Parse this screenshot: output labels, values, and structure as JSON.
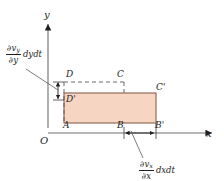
{
  "figure": {
    "type": "fluid-element-deformation-diagram",
    "background": "#ffffff",
    "ink_color": "#231f20",
    "fill_color": "#f6d6c3",
    "fill_stroke": "#8c5f4e"
  },
  "axes": {
    "x_label": "x",
    "y_label": "y",
    "origin_label": "O",
    "x_axis": {
      "y_px": 133,
      "x_start_px": 48,
      "x_end_px": 214
    },
    "y_axis": {
      "x_px": 48,
      "y_start_px": 124,
      "y_end_px": 22
    }
  },
  "vertices": [
    {
      "name": "vertex-A",
      "label": "A",
      "prime": "",
      "x_px": 64,
      "y_px": 127
    },
    {
      "name": "vertex-B",
      "label": "B",
      "prime": "",
      "x_px": 118,
      "y_px": 127
    },
    {
      "name": "vertex-B-prime",
      "label": "B",
      "prime": "'",
      "x_px": 155,
      "y_px": 127
    },
    {
      "name": "vertex-C",
      "label": "C",
      "prime": "",
      "x_px": 119,
      "y_px": 77
    },
    {
      "name": "vertex-C-prime",
      "label": "C",
      "prime": "'",
      "x_px": 157,
      "y_px": 89
    },
    {
      "name": "vertex-D",
      "label": "D",
      "prime": "",
      "x_px": 67,
      "y_px": 77
    },
    {
      "name": "vertex-D-prime",
      "label": "D",
      "prime": "'",
      "x_px": 67,
      "y_px": 99
    }
  ],
  "shapes": {
    "deformed_rectangle": {
      "name": "deformed-element",
      "x_px": 64,
      "y_px": 93,
      "width_px": 92,
      "height_px": 30
    },
    "original_square_dashed": {
      "name": "original-element-dashed",
      "x_px": 64,
      "y_px": 82,
      "width_px": 60,
      "height_px": 41
    }
  },
  "annotations": {
    "y_strain": {
      "name": "vertical-strain-label",
      "numerator_partial": "∂v",
      "numerator_sub": "y",
      "denominator_partial": "∂y",
      "tail": "dydt",
      "full_text": "∂v_y/∂y dydt"
    },
    "x_strain": {
      "name": "horizontal-strain-label",
      "numerator_partial": "∂v",
      "numerator_sub": "x",
      "denominator_partial": "∂x",
      "tail": "dxdt",
      "full_text": "∂v_x/∂x dxdt"
    }
  },
  "dimension_arrows": [
    {
      "name": "vertical-dimension-arrow",
      "orientation": "vertical",
      "x_px": 58,
      "y1_px": 82,
      "y2_px": 100
    },
    {
      "name": "horizontal-dimension-arrow",
      "orientation": "horizontal",
      "y_px": 133,
      "x1_px": 124,
      "x2_px": 156
    }
  ]
}
